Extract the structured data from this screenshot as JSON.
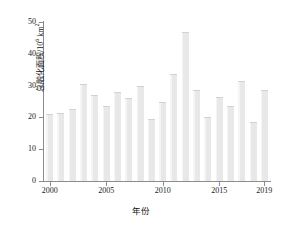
{
  "chart_data": {
    "type": "bar",
    "title": "",
    "xlabel": "年份",
    "ylabel": "总融化面积/10⁶ km²",
    "ylabel_text": "总融化面积/10",
    "ylabel_exp": "6",
    "ylabel_unit": " km",
    "ylabel_unit_exp": "2",
    "categories": [
      2000,
      2001,
      2002,
      2003,
      2004,
      2005,
      2006,
      2007,
      2008,
      2009,
      2010,
      2011,
      2012,
      2013,
      2014,
      2015,
      2016,
      2017,
      2018,
      2019
    ],
    "values": [
      21.0,
      21.5,
      22.5,
      30.5,
      27.0,
      23.5,
      28.0,
      26.0,
      30.0,
      19.5,
      25.0,
      33.5,
      47.0,
      28.5,
      20.0,
      26.5,
      23.5,
      31.5,
      18.5,
      28.5
    ],
    "ylim": [
      0,
      50
    ],
    "yticks": [
      0,
      10,
      20,
      30,
      40,
      50
    ],
    "ytick_labels": [
      "0",
      "10",
      "20",
      "30",
      "40",
      "50"
    ],
    "xtick_values": [
      2000,
      2005,
      2010,
      2015,
      2019
    ],
    "xtick_labels": [
      "2000",
      "2005",
      "2010",
      "2015",
      "2019"
    ],
    "grid": false,
    "legend": null,
    "bar_color": "#e8e8e8",
    "axis_color": "#8c8c8c",
    "text_color": "#1a1a1a"
  }
}
